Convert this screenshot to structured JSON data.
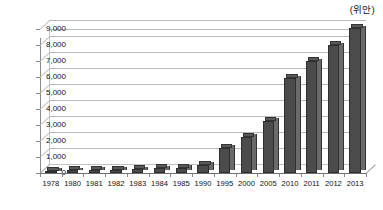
{
  "unit_caption": "(위안)",
  "chart_data": {
    "type": "bar",
    "title": "",
    "subtitle": "",
    "xlabel": "",
    "ylabel": "",
    "unit_label": "(위안)",
    "categories": [
      "1978",
      "1980",
      "1981",
      "1982",
      "1983",
      "1984",
      "1985",
      "1990",
      "1995",
      "2000",
      "2005",
      "2010",
      "2011",
      "2012",
      "2013"
    ],
    "values": [
      134,
      178,
      194,
      212,
      248,
      283,
      317,
      510,
      1578,
      2253,
      3255,
      5919,
      6977,
      7979,
      9054
    ],
    "series": [
      {
        "name": "",
        "values": [
          134,
          178,
          194,
          212,
          248,
          283,
          317,
          510,
          1578,
          2253,
          3255,
          5919,
          6977,
          7979,
          9054
        ]
      }
    ],
    "ylim": [
      0,
      9000
    ],
    "ytick_values": [
      0,
      1000,
      2000,
      3000,
      4000,
      5000,
      6000,
      7000,
      8000,
      9000
    ],
    "ytick_labels": [
      "0",
      "1,000",
      "2,000",
      "3,000",
      "4,000",
      "5,000",
      "6,000",
      "7,000",
      "8,000",
      "9,000"
    ],
    "grid": true,
    "grid_axis": "y",
    "legend": false,
    "legend_position": "none",
    "style": "3d-column",
    "bar_color": "#4b4b4b",
    "bar_side_color": "#6a6a6a",
    "bar_top_color": "#595959",
    "grid_color": "#b9b9b9",
    "axis_color": "#6f6f6f",
    "background": "#ffffff"
  }
}
